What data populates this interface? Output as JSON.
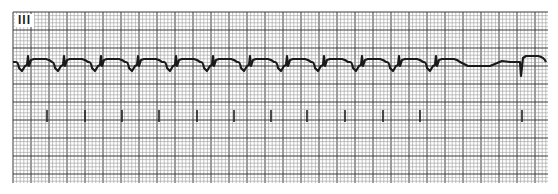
{
  "ecg": {
    "lead_label": "III",
    "grid": {
      "left": 13,
      "top": 12,
      "right": 548,
      "bottom": 183,
      "minor_px": 3.6,
      "major_px": 18,
      "minor_color": "#9a9a9a",
      "major_color": "#3a3a3a"
    },
    "trace": {
      "color": "#1a1a1a",
      "baseline_y": 62,
      "beats_x": [
        22,
        58,
        95,
        132,
        170,
        207,
        244,
        281,
        318,
        356,
        393,
        430
      ],
      "pause_end_x": 510,
      "final_beat_x": 520
    },
    "markers_x": [
      47,
      85,
      122,
      159,
      197,
      234,
      271,
      307,
      345,
      383,
      420,
      522
    ],
    "markers_y": [
      110,
      122
    ]
  }
}
